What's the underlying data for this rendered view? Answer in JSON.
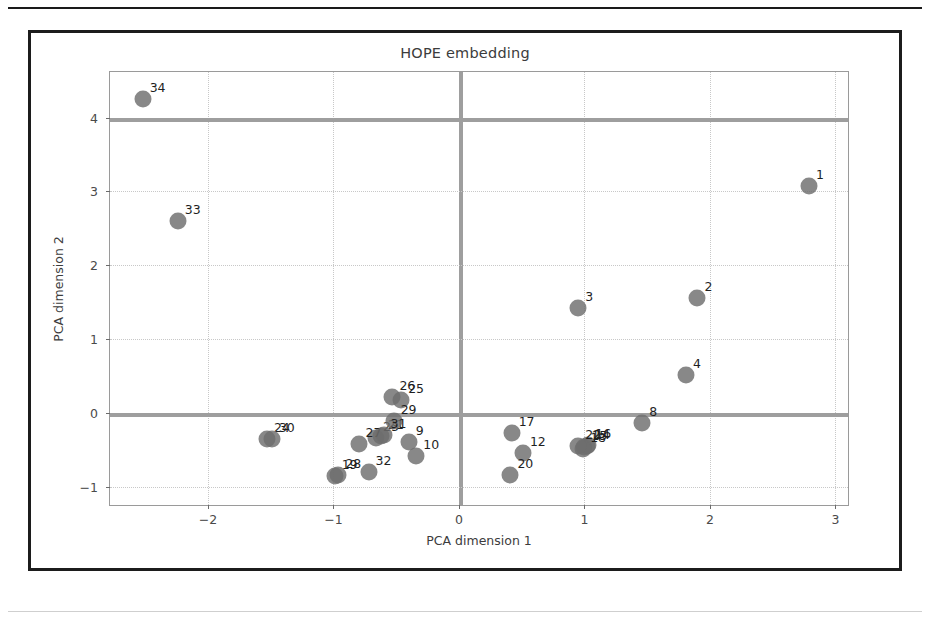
{
  "figure": {
    "title": "HOPE embedding",
    "marker_color": "#6e6e6e",
    "frame_color": "#1c1c1c",
    "background": "#ffffff"
  },
  "chart_data": {
    "type": "scatter",
    "title": "HOPE embedding",
    "xlabel": "PCA dimension 1",
    "ylabel": "PCA dimension 2",
    "xlim": [
      -2.78,
      3.1
    ],
    "ylim": [
      -1.25,
      4.62
    ],
    "xticks": [
      -2,
      -1,
      0,
      1,
      2,
      3
    ],
    "xtick_labels": [
      "−2",
      "−1",
      "0",
      "1",
      "2",
      "3"
    ],
    "yticks": [
      -1,
      0,
      1,
      2,
      3,
      4
    ],
    "ytick_labels": [
      "−1",
      "0",
      "1",
      "2",
      "3",
      "4"
    ],
    "grid": true,
    "legend": null,
    "points": [
      {
        "label": "1",
        "x": 2.79,
        "y": 3.08
      },
      {
        "label": "2",
        "x": 1.9,
        "y": 1.56
      },
      {
        "label": "3",
        "x": 0.95,
        "y": 1.42
      },
      {
        "label": "4",
        "x": 1.81,
        "y": 0.51
      },
      {
        "label": "8",
        "x": 1.46,
        "y": -0.14
      },
      {
        "label": "9",
        "x": -0.4,
        "y": -0.39
      },
      {
        "label": "10",
        "x": -0.34,
        "y": -0.58
      },
      {
        "label": "12",
        "x": 0.51,
        "y": -0.54
      },
      {
        "label": "14",
        "x": 1.02,
        "y": -0.45
      },
      {
        "label": "15",
        "x": 1.0,
        "y": -0.47
      },
      {
        "label": "16",
        "x": 1.03,
        "y": -0.43
      },
      {
        "label": "17",
        "x": 0.42,
        "y": -0.27
      },
      {
        "label": "18",
        "x": 0.99,
        "y": -0.49
      },
      {
        "label": "19",
        "x": -0.99,
        "y": -0.86
      },
      {
        "label": "20",
        "x": 0.41,
        "y": -0.84
      },
      {
        "label": "21",
        "x": -0.62,
        "y": -0.32
      },
      {
        "label": "22",
        "x": 0.95,
        "y": -0.45
      },
      {
        "label": "23",
        "x": -0.66,
        "y": -0.34
      },
      {
        "label": "24",
        "x": -1.53,
        "y": -0.35
      },
      {
        "label": "25",
        "x": -0.46,
        "y": 0.18
      },
      {
        "label": "26",
        "x": -0.53,
        "y": 0.21
      },
      {
        "label": "27",
        "x": -0.8,
        "y": -0.42
      },
      {
        "label": "28",
        "x": -0.96,
        "y": -0.85
      },
      {
        "label": "29",
        "x": -0.52,
        "y": -0.11
      },
      {
        "label": "30",
        "x": -1.49,
        "y": -0.36
      },
      {
        "label": "31",
        "x": -0.6,
        "y": -0.3
      },
      {
        "label": "32",
        "x": -0.72,
        "y": -0.8
      },
      {
        "label": "33",
        "x": -2.24,
        "y": 2.6
      },
      {
        "label": "34",
        "x": -2.52,
        "y": 4.26
      }
    ]
  }
}
